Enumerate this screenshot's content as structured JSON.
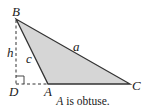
{
  "figure": {
    "type": "triangle-diagram",
    "fill_color": "#d6d6d6",
    "stroke_color": "#333333",
    "vertices": {
      "B": {
        "label": "B"
      },
      "A": {
        "label": "A"
      },
      "C": {
        "label": "C"
      },
      "D": {
        "label": "D"
      }
    },
    "sides": {
      "a": {
        "label": "a"
      },
      "c": {
        "label": "c"
      }
    },
    "height": {
      "label": "h"
    },
    "right_angle_marker": true
  },
  "caption": {
    "vertex": "A",
    "text": " is obtuse."
  }
}
